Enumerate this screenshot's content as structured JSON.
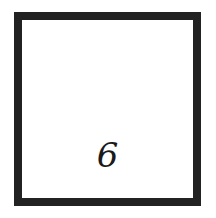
{
  "card": {
    "numeral": "6",
    "border_color": "#222222",
    "background_color": "#ffffff"
  }
}
